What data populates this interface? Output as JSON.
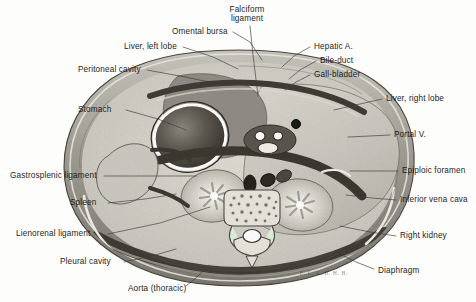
{
  "figure": {
    "caption_signature": "E. L. A. B. H. B.",
    "background_color": "#fdfdfb",
    "text_color": "#1d1d1d",
    "leader_color": "#3a3a3a"
  },
  "labels": {
    "top": [
      {
        "id": "falciform-ligament",
        "text": "Falciform\nligament",
        "x": 246,
        "y": 7,
        "align": "center",
        "leader": [
          [
            250,
            26
          ],
          [
            253,
            55
          ],
          [
            258,
            96
          ]
        ]
      },
      {
        "id": "omental-bursa",
        "text": "Omental bursa",
        "x": 172,
        "y": 28,
        "align": "left",
        "leader": [
          [
            233,
            32
          ],
          [
            250,
            42
          ],
          [
            262,
            60
          ]
        ]
      },
      {
        "id": "liver-left-lobe",
        "text": "Liver, left lobe",
        "x": 124,
        "y": 43,
        "align": "left",
        "leader": [
          [
            183,
            47
          ],
          [
            213,
            57
          ],
          [
            238,
            69
          ]
        ]
      },
      {
        "id": "peritoneal-cavity",
        "text": "Peritoneal cavity",
        "x": 78,
        "y": 66,
        "align": "left",
        "leader": [
          [
            147,
            70
          ],
          [
            185,
            77
          ],
          [
            214,
            83
          ]
        ]
      },
      {
        "id": "hepatic-artery",
        "text": "Hepatic A.",
        "x": 312,
        "y": 43,
        "align": "left",
        "leader": [
          [
            310,
            47
          ],
          [
            294,
            56
          ],
          [
            282,
            67
          ]
        ]
      },
      {
        "id": "bile-duct",
        "text": "Bile-duct",
        "x": 318,
        "y": 57,
        "align": "left",
        "leader": [
          [
            316,
            61
          ],
          [
            300,
            70
          ],
          [
            289,
            79
          ]
        ]
      },
      {
        "id": "gall-bladder",
        "text": "Gall-bladder",
        "x": 312,
        "y": 71,
        "align": "left",
        "leader": [
          [
            310,
            75
          ],
          [
            296,
            82
          ],
          [
            285,
            90
          ]
        ]
      }
    ],
    "right": [
      {
        "id": "liver-right-lobe",
        "text": "Liver, right lobe",
        "x": 384,
        "y": 95,
        "align": "left",
        "leader": [
          [
            382,
            99
          ],
          [
            360,
            104
          ],
          [
            334,
            110
          ]
        ]
      },
      {
        "id": "portal-vein",
        "text": "Portal V.",
        "x": 392,
        "y": 131,
        "align": "left",
        "leader": [
          [
            390,
            135
          ],
          [
            370,
            136
          ],
          [
            348,
            137
          ]
        ]
      },
      {
        "id": "epiploic-foramen",
        "text": "Epiploic foramen",
        "x": 400,
        "y": 167,
        "align": "left",
        "leader": [
          [
            398,
            171
          ],
          [
            374,
            171
          ],
          [
            350,
            171
          ]
        ]
      },
      {
        "id": "inferior-vena-cava",
        "text": "Inferior vena cava",
        "x": 398,
        "y": 196,
        "align": "left",
        "leader": [
          [
            396,
            200
          ],
          [
            372,
            198
          ],
          [
            346,
            195
          ]
        ]
      },
      {
        "id": "right-kidney",
        "text": "Right kidney",
        "x": 398,
        "y": 232,
        "align": "left",
        "leader": [
          [
            396,
            236
          ],
          [
            370,
            232
          ],
          [
            340,
            226
          ]
        ]
      },
      {
        "id": "diaphragm",
        "text": "Diaphragm",
        "x": 376,
        "y": 269,
        "align": "left",
        "leader": [
          [
            374,
            269
          ],
          [
            356,
            262
          ],
          [
            336,
            252
          ]
        ]
      }
    ],
    "left": [
      {
        "id": "stomach",
        "text": "Stomach",
        "x": 78,
        "y": 106,
        "align": "left",
        "leader": [
          [
            126,
            110
          ],
          [
            158,
            119
          ],
          [
            186,
            130
          ]
        ]
      },
      {
        "id": "gastrosplenic-ligament",
        "text": "Gastrosplenic ligament",
        "x": 10,
        "y": 172,
        "align": "left",
        "leader": [
          [
            104,
            176
          ],
          [
            150,
            176
          ],
          [
            196,
            176
          ]
        ]
      },
      {
        "id": "spleen",
        "text": "Spleen",
        "x": 70,
        "y": 200,
        "align": "left",
        "leader": [
          [
            108,
            203
          ],
          [
            145,
            199
          ],
          [
            176,
            194
          ]
        ]
      },
      {
        "id": "lienorenal-ligament",
        "text": "Lienorenal ligament",
        "x": 16,
        "y": 231,
        "align": "left",
        "leader": [
          [
            108,
            234
          ],
          [
            160,
            223
          ],
          [
            210,
            207
          ]
        ]
      },
      {
        "id": "pleural-cavity",
        "text": "Pleural cavity",
        "x": 60,
        "y": 260,
        "align": "left",
        "leader": [
          [
            124,
            262
          ],
          [
            152,
            256
          ],
          [
            176,
            249
          ]
        ]
      }
    ],
    "bottom": [
      {
        "id": "aorta-thoracic",
        "text": "Aorta (thoracic)",
        "x": 128,
        "y": 287,
        "align": "left",
        "leader": [
          [
            186,
            286
          ],
          [
            197,
            277
          ],
          [
            209,
            265
          ]
        ]
      }
    ]
  },
  "structures": [
    {
      "id": "body-wall-outline",
      "name": "body wall",
      "fill": "#b9b7ae"
    },
    {
      "id": "peritoneal-cavity-space",
      "name": "peritoneal cavity",
      "fill": "#d8d6cd"
    },
    {
      "id": "liver-left-lobe-mass",
      "name": "liver, left lobe",
      "fill": "#8e8c84"
    },
    {
      "id": "liver-right-lobe-mass",
      "name": "liver, right lobe",
      "fill": "#cbc9c0"
    },
    {
      "id": "stomach-lumen",
      "name": "stomach",
      "fill": "#555047"
    },
    {
      "id": "right-kidney-mass",
      "name": "right kidney",
      "fill": "#d6d4cb"
    },
    {
      "id": "left-kidney-mass",
      "name": "left kidney",
      "fill": "#d6d4cb"
    },
    {
      "id": "vertebral-body",
      "name": "vertebra",
      "fill": "#e2e0d7"
    },
    {
      "id": "aorta-lumen",
      "name": "aorta",
      "fill": "#2e2b26"
    },
    {
      "id": "inferior-vena-cava-lumen",
      "name": "inferior vena cava",
      "fill": "#3a3730"
    },
    {
      "id": "diaphragm-band",
      "name": "diaphragm",
      "fill": "#3e3b34"
    }
  ]
}
